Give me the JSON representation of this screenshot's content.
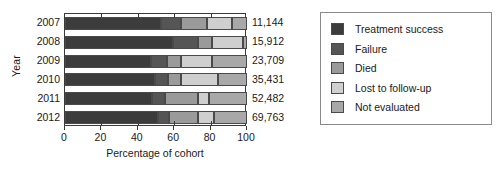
{
  "chart_data": {
    "type": "bar",
    "orientation": "horizontal",
    "stacked": true,
    "title": "",
    "xlabel": "Percentage of cohort",
    "ylabel": "Year",
    "xlim": [
      0,
      100
    ],
    "xticks": [
      0,
      20,
      40,
      60,
      80,
      100
    ],
    "grid": false,
    "legend_position": "right",
    "categories": [
      "2007",
      "2008",
      "2009",
      "2010",
      "2011",
      "2012"
    ],
    "cohort_totals": [
      "11,144",
      "15,912",
      "23,709",
      "35,431",
      "52,482",
      "69,763"
    ],
    "series": [
      {
        "name": "Treatment success",
        "color": "#3c3c3c",
        "values": [
          53.0,
          59.5,
          47.5,
          49.5,
          48.0,
          51.0
        ]
      },
      {
        "name": "Failure",
        "color": "#555555",
        "values": [
          11.0,
          13.5,
          8.5,
          7.0,
          7.0,
          6.0
        ]
      },
      {
        "name": "Died",
        "color": "#9a9a9a",
        "values": [
          14.0,
          7.5,
          7.5,
          7.5,
          18.0,
          16.0
        ]
      },
      {
        "name": "Lost to follow-up",
        "color": "#cfcfcf",
        "values": [
          14.0,
          17.5,
          17.0,
          20.0,
          6.0,
          9.0
        ]
      },
      {
        "name": "Not evaluated",
        "color": "#a8a8a8",
        "values": [
          8.0,
          2.0,
          19.5,
          16.0,
          21.0,
          18.0
        ]
      }
    ]
  },
  "axis": {
    "y_title": "Year",
    "x_title": "Percentage of cohort"
  }
}
